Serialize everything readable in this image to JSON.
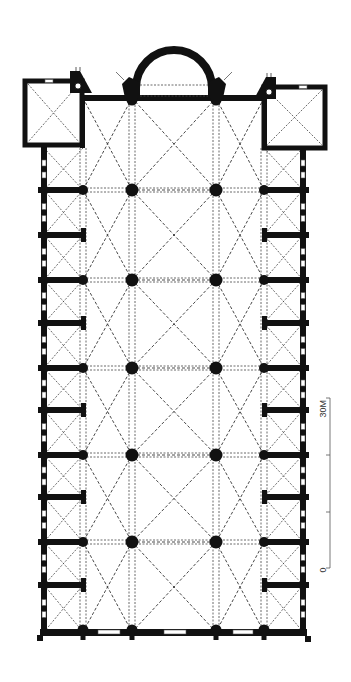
{
  "figure": {
    "type": "architectural-floor-plan"
  },
  "colors": {
    "wall": "#111111",
    "vault_lines": "#333333",
    "background": "#ffffff",
    "scale": "#555555"
  },
  "scale_bar": {
    "label_top": "30M",
    "label_bottom": "0",
    "x": 330,
    "y_top": 398,
    "y_bottom": 568,
    "ticks_y": [
      455,
      512
    ]
  },
  "plan": {
    "outer_wall_x": [
      44,
      303
    ],
    "aisle_pier_x": [
      83,
      264
    ],
    "nave_pier_x": [
      132,
      216
    ],
    "nave_top_y": 98,
    "bottom_wall_y": 632,
    "main_pier_rows_y": [
      190,
      280,
      368,
      455,
      542
    ],
    "intermediate_rows_y": [
      235,
      323,
      410,
      497,
      585
    ],
    "apse": {
      "cx": 174,
      "base_y": 88,
      "outer_r": 38,
      "inner_r": 30
    },
    "chapels": [
      {
        "name": "left-chapel",
        "x1": 25,
        "y1": 81,
        "x2": 82,
        "y2": 145
      },
      {
        "name": "right-chapel",
        "x1": 264,
        "y1": 87,
        "x2": 325,
        "y2": 148
      }
    ]
  }
}
